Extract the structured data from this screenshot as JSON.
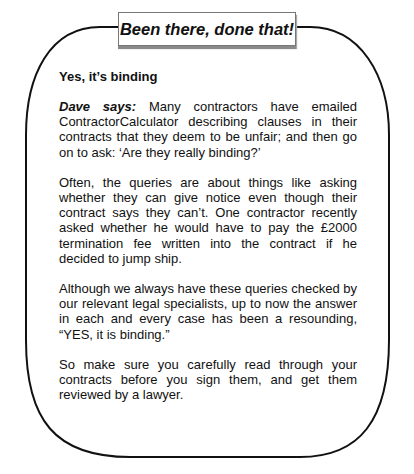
{
  "box": {
    "title": "Been there, done that!",
    "heading": "Yes, it’s binding",
    "author_label": "Dave says:",
    "paragraphs": [
      " Many contractors have emailed ContractorCalculator describing clauses in their contracts that they deem to be unfair; and then go on to ask: ‘Are they really binding?’",
      "Often, the queries are about things like asking whether they can give notice even though their contract says they can’t. One contractor recently asked whether he would have to pay the £2000 termination fee written into the contract if he decided to jump ship.",
      "Although we always have these queries checked by our relevant legal specialists, up to now the answer in each and every case has been a resounding, “YES, it is binding.”",
      "So make sure you carefully read through your contracts before you sign them, and get them reviewed by a lawyer."
    ]
  },
  "colors": {
    "frame_stroke": "#111111",
    "title_shadow": "#8a8a8a",
    "text": "#111111"
  }
}
